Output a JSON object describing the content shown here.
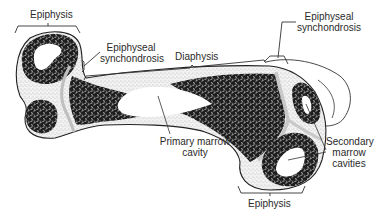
{
  "diagram": {
    "colors": {
      "background": "#ffffff",
      "outline": "#222222",
      "spongy_bone": "#1e1e1e",
      "cartilage_stipple": "#d4d4d4",
      "label_text": "#2a2a2a"
    },
    "labels": {
      "epiphysis_left": "Epiphysis",
      "epiphyseal_synchondrosis_left_line1": "Epiphyseal",
      "epiphyseal_synchondrosis_left_line2": "synchondrosis",
      "diaphysis": "Diaphysis",
      "epiphyseal_synchondrosis_right_line1": "Epiphyseal",
      "epiphyseal_synchondrosis_right_line2": "synchondrosis",
      "primary_marrow_cavity_line1": "Primary marrow",
      "primary_marrow_cavity_line2": "cavity",
      "secondary_marrow_cavities_line1": "Secondary",
      "secondary_marrow_cavities_line2": "marrow",
      "secondary_marrow_cavities_line3": "cavities",
      "epiphysis_bottom": "Epiphysis"
    }
  }
}
